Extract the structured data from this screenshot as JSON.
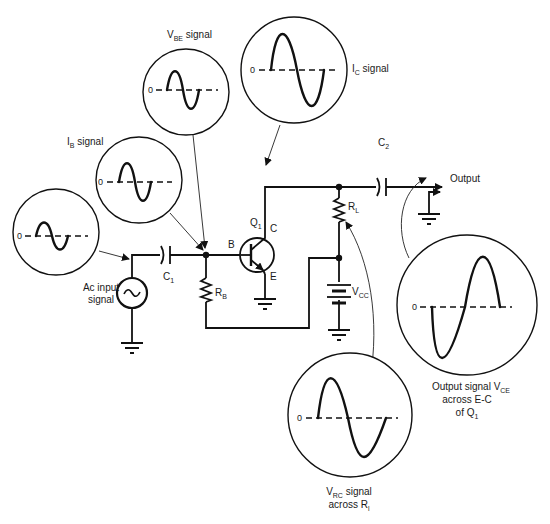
{
  "diagram": {
    "type": "common-emitter transistor amplifier schematic with signal waveforms",
    "components": {
      "q1": {
        "label": "Q",
        "sub": "1"
      },
      "base": "B",
      "collector": "C",
      "emitter": "E",
      "c1": {
        "label": "C",
        "sub": "1"
      },
      "c2": {
        "label": "C",
        "sub": "2"
      },
      "rb": {
        "label": "R",
        "sub": "B"
      },
      "rl": {
        "label": "R",
        "sub": "L"
      },
      "vcc": {
        "label": "V",
        "sub": "CC"
      },
      "source": {
        "line1": "Ac input",
        "line2": "signal"
      },
      "output": "Output"
    },
    "signals": {
      "input": {
        "zero": "0"
      },
      "ib": {
        "zero": "0",
        "label": "I",
        "sub": "B",
        "suffix": " signal"
      },
      "vbe": {
        "zero": "0",
        "label": "V",
        "sub": "BE",
        "suffix": " signal"
      },
      "ic": {
        "zero": "0",
        "label": "I",
        "sub": "C",
        "suffix": " signal"
      },
      "vrc": {
        "zero": "0",
        "label": "V",
        "sub": "RC",
        "suffix": " signal",
        "line2": "across R",
        "line2_sub": "l"
      },
      "vce": {
        "zero": "0",
        "line1": "Output signal V",
        "line1_sub": "CE",
        "line2": "across E-C",
        "line3": "of Q",
        "line3_sub": "1"
      }
    }
  }
}
